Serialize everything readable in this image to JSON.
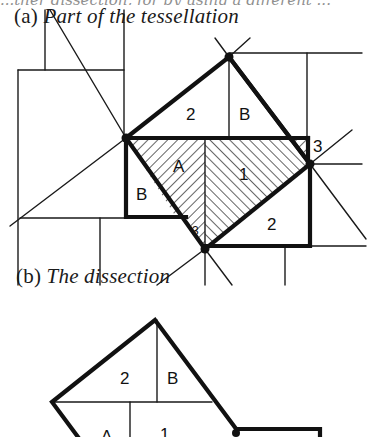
{
  "top_cut_text": "...ther dissection, for by using a different ...",
  "captions": {
    "a_prefix": "(a)",
    "a_title": "Part of the tessellation",
    "b_prefix": "(b)",
    "b_title": "The dissection"
  },
  "diagram_a": {
    "labels": {
      "piece_2_top": "2",
      "piece_B_top": "B",
      "piece_3": "3",
      "piece_A": "A",
      "piece_1": "1",
      "piece_B_left": "B",
      "piece_3_small": "3",
      "piece_2_bottom": "2"
    },
    "hatched_pieces": [
      "A",
      "1",
      "3"
    ],
    "vertices": [
      [
        126,
        138
      ],
      [
        229,
        57
      ],
      [
        310,
        164
      ],
      [
        205,
        249
      ]
    ]
  },
  "diagram_b": {
    "labels": {
      "piece_2": "2",
      "piece_B": "B",
      "piece_A": "A",
      "piece_1": "1"
    },
    "vertices": [
      [
        155,
        320
      ],
      [
        52,
        402
      ],
      [
        237,
        432
      ]
    ]
  }
}
